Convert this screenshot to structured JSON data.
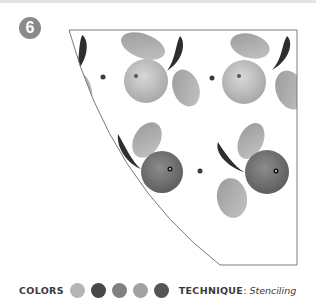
{
  "step": {
    "number": "6"
  },
  "illustration": {
    "description": "Stenciled apple and leaf motif on a curved quarter-panel shape",
    "outline_color": "#7a7a7a"
  },
  "footer": {
    "colors_label": "COLORS",
    "swatches": [
      {
        "name": "light-gray",
        "hex": "#b4b4b4"
      },
      {
        "name": "dark-gray",
        "hex": "#474747"
      },
      {
        "name": "medium-gray",
        "hex": "#808080"
      },
      {
        "name": "light-medium-gray",
        "hex": "#a2a2a2"
      },
      {
        "name": "charcoal",
        "hex": "#555555"
      }
    ],
    "technique_label": "TECHNIQUE",
    "technique_separator": ":",
    "technique_value": "Stenciling"
  }
}
